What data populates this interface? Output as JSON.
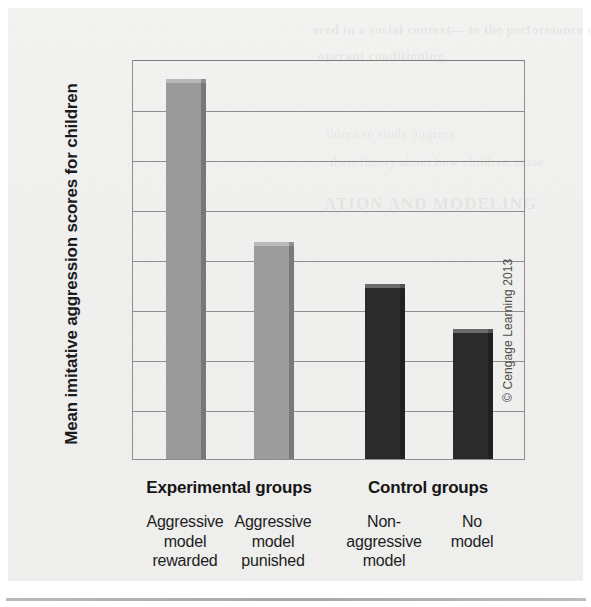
{
  "figure": {
    "credit": "© Cengage Learning 2013",
    "ghost_text": {
      "line1": "ered in a social context— to the performance of",
      "line2": "operant conditioning.",
      "line3": "ildren to study aggress",
      "line4": "their theory about how children mode",
      "line5": "ATION AND MODELING"
    }
  },
  "chart_data": {
    "type": "bar",
    "title": "",
    "xlabel": "",
    "ylabel": "Mean imitative aggression scores for children",
    "ylim": [
      0,
      16
    ],
    "yticks": [
      0,
      2,
      4,
      6,
      8,
      10,
      12,
      14,
      16
    ],
    "ytick_labels": [
      "0",
      "2",
      "4",
      "6",
      "8",
      "10",
      "12",
      "14",
      "16"
    ],
    "grid": true,
    "legend": "none",
    "categories": [
      "Aggressive model rewarded",
      "Aggressive model punished",
      "Non-aggressive model",
      "No model"
    ],
    "category_lines": [
      [
        "Aggressive",
        "model",
        "rewarded"
      ],
      [
        "Aggressive",
        "model",
        "punished"
      ],
      [
        "Non-",
        "aggressive",
        "model"
      ],
      [
        "No",
        "model"
      ]
    ],
    "values": [
      15.2,
      8.7,
      7.0,
      5.2
    ],
    "bar_colors": [
      "#9a9a9a",
      "#9c9c9c",
      "#2b2b2b",
      "#2b2b2b"
    ],
    "groups": [
      {
        "label": "Experimental groups",
        "members": [
          0,
          1
        ]
      },
      {
        "label": "Control groups",
        "members": [
          2,
          3
        ]
      }
    ]
  }
}
